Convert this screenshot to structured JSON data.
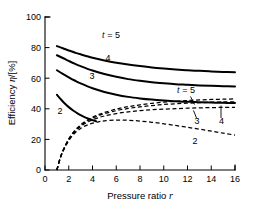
{
  "chart_data": {
    "type": "line",
    "title": "",
    "xlabel": "Pressure ratio r",
    "xlabel_main": "Pressure ratio",
    "xlabel_symbol": "r",
    "ylabel": "Efficiency η/[%]",
    "ylabel_main": "Efficiency",
    "ylabel_symbol": "η",
    "ylabel_units": "/[%]",
    "xlim": [
      0,
      16
    ],
    "ylim": [
      0,
      100
    ],
    "xticks": [
      0,
      2,
      4,
      6,
      8,
      10,
      12,
      14,
      16
    ],
    "yticks": [
      0,
      20,
      40,
      60,
      80,
      100
    ],
    "xticklabels": [
      "0",
      "2",
      "4",
      "6",
      "8",
      "10",
      "12",
      "14",
      "16"
    ],
    "yticklabels": [
      "0",
      "20",
      "40",
      "60",
      "80",
      "100"
    ],
    "grid": false,
    "legend_position": "inline-labels",
    "parameter_symbol": "t",
    "series": [
      {
        "name": "t = 5 (solid)",
        "t": 5,
        "style": "solid",
        "label": "t = 5",
        "label_symbol": "t",
        "label_text": "= 5",
        "x": [
          1.0,
          1.5,
          2.0,
          2.5,
          3.0,
          4.0,
          5.0,
          6.0,
          7.0,
          8.0,
          9.0,
          10.0,
          11.0,
          12.0,
          13.0,
          14.0,
          15.0,
          16.0
        ],
        "y": [
          81.0,
          79.6,
          78.1,
          76.8,
          75.6,
          73.4,
          71.6,
          70.1,
          68.9,
          67.9,
          67.0,
          66.3,
          65.7,
          65.2,
          64.8,
          64.4,
          64.1,
          63.9
        ]
      },
      {
        "name": "t = 4 (solid)",
        "t": 4,
        "style": "solid",
        "label": "4",
        "x": [
          1.0,
          1.5,
          2.0,
          2.5,
          3.0,
          4.0,
          5.0,
          6.0,
          7.0,
          8.0,
          9.0,
          10.0,
          11.0,
          12.0,
          13.0,
          14.0,
          15.0,
          16.0
        ],
        "y": [
          75.0,
          73.2,
          71.3,
          69.5,
          67.9,
          65.0,
          62.7,
          60.9,
          59.4,
          58.3,
          57.4,
          56.7,
          56.1,
          55.7,
          55.3,
          55.0,
          54.8,
          54.6
        ]
      },
      {
        "name": "t = 3 (solid)",
        "t": 3,
        "style": "solid",
        "label": "3",
        "x": [
          1.0,
          1.5,
          2.0,
          2.5,
          3.0,
          4.0,
          5.0,
          6.0,
          7.0,
          8.0,
          9.0,
          10.0,
          11.0,
          12.0,
          13.0,
          14.0,
          15.0,
          16.0
        ],
        "y": [
          65.2,
          62.8,
          60.6,
          58.5,
          56.6,
          53.4,
          51.0,
          49.2,
          47.8,
          46.8,
          46.0,
          45.4,
          44.9,
          44.6,
          44.3,
          44.1,
          43.9,
          43.8
        ]
      },
      {
        "name": "t = 2 (solid)",
        "t": 2,
        "style": "solid",
        "label": "2",
        "x": [
          1.0,
          1.3,
          1.6,
          2.0,
          2.4,
          2.8,
          3.2,
          3.6,
          4.0,
          4.3
        ],
        "y": [
          49.2,
          46.5,
          44.0,
          41.1,
          38.7,
          36.7,
          35.1,
          33.7,
          32.6,
          31.9
        ]
      },
      {
        "name": "t = 2 (dashed)",
        "t": 2,
        "style": "dashed",
        "label": "2",
        "x": [
          1.0,
          1.3,
          1.6,
          2.0,
          2.5,
          3.0,
          3.5,
          4.0,
          4.5,
          5.0,
          6.0,
          7.0,
          8.0,
          9.0,
          10.0,
          11.0,
          12.0,
          13.0,
          14.0,
          15.0,
          16.0
        ],
        "y": [
          0.0,
          8.0,
          13.5,
          19.2,
          24.0,
          27.1,
          29.2,
          30.6,
          31.5,
          32.1,
          32.6,
          32.5,
          32.0,
          31.2,
          30.2,
          29.1,
          27.9,
          26.7,
          25.4,
          24.1,
          22.8
        ]
      },
      {
        "name": "t = 3 (dashed)",
        "t": 3,
        "style": "dashed",
        "label": "3",
        "x": [
          1.0,
          1.3,
          1.6,
          2.0,
          2.5,
          3.0,
          3.5,
          4.0,
          4.5,
          5.0,
          6.0,
          7.0,
          8.0,
          9.0,
          10.0,
          11.0,
          12.0,
          13.0,
          14.0,
          15.0,
          16.0
        ],
        "y": [
          0.0,
          8.2,
          13.9,
          19.8,
          25.0,
          28.4,
          30.9,
          32.8,
          34.2,
          35.3,
          36.9,
          38.0,
          38.8,
          39.4,
          39.8,
          40.1,
          40.4,
          40.6,
          40.8,
          40.9,
          41.0
        ]
      },
      {
        "name": "t = 4 (dashed)",
        "t": 4,
        "style": "dashed",
        "label": "4",
        "x": [
          1.0,
          1.3,
          1.6,
          2.0,
          2.5,
          3.0,
          3.5,
          4.0,
          4.5,
          5.0,
          6.0,
          7.0,
          8.0,
          9.0,
          10.0,
          11.0,
          12.0,
          13.0,
          14.0,
          15.0,
          16.0
        ],
        "y": [
          0.0,
          8.3,
          14.1,
          20.1,
          25.5,
          29.1,
          31.8,
          33.9,
          35.5,
          36.8,
          38.8,
          40.2,
          41.3,
          42.1,
          42.8,
          43.3,
          43.7,
          44.0,
          44.3,
          44.5,
          44.6
        ]
      },
      {
        "name": "t = 5 (dashed)",
        "t": 5,
        "style": "dashed",
        "label": "t = 5",
        "label_symbol": "t",
        "label_text": "= 5",
        "x": [
          1.0,
          1.3,
          1.6,
          2.0,
          2.5,
          3.0,
          3.5,
          4.0,
          4.5,
          5.0,
          6.0,
          7.0,
          8.0,
          9.0,
          10.0,
          11.0,
          12.0,
          13.0,
          14.0,
          15.0,
          16.0
        ],
        "y": [
          0.0,
          8.4,
          14.2,
          20.3,
          25.8,
          29.5,
          32.3,
          34.5,
          36.2,
          37.6,
          39.8,
          41.4,
          42.6,
          43.6,
          44.3,
          44.9,
          45.4,
          45.8,
          46.1,
          46.3,
          46.5
        ]
      }
    ],
    "annotations": [
      {
        "name": "label-solid-t5",
        "text": "t = 5",
        "x": 5.6,
        "y": 78.0
      },
      {
        "name": "label-solid-4",
        "text": "4",
        "x": 5.3,
        "y": 64.5
      },
      {
        "name": "label-solid-3",
        "text": "3",
        "x": 4.0,
        "y": 54.0
      },
      {
        "name": "label-solid-2",
        "text": "2",
        "x": 1.3,
        "y": 37.0
      },
      {
        "name": "label-dashed-t5",
        "text": "t = 5",
        "x": 11.2,
        "y": 50.5
      },
      {
        "name": "label-dashed-3",
        "text": "3",
        "x": 12.3,
        "y": 36.0
      },
      {
        "name": "label-dashed-4",
        "text": "4",
        "x": 14.6,
        "y": 36.0
      },
      {
        "name": "label-dashed-2",
        "text": "2",
        "x": 12.6,
        "y": 19.0
      }
    ]
  }
}
